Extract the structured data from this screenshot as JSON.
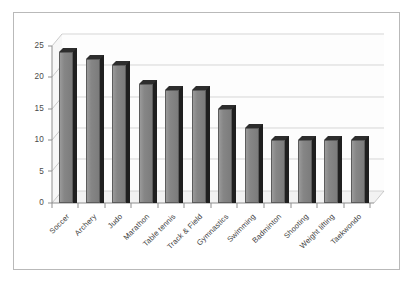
{
  "chart_data": {
    "type": "bar",
    "title": "",
    "subtitle": "",
    "xlabel": "",
    "ylabel": "",
    "categories": [
      "Soccer",
      "Archery",
      "Judo",
      "Marathon",
      "Table tennis",
      "Track & Field",
      "Gymnastics",
      "Swimming",
      "Badminton",
      "Shooting",
      "Weight lifting",
      "Taekwondo"
    ],
    "values": [
      24,
      23,
      22,
      19,
      18,
      18,
      15,
      12,
      10,
      10,
      10,
      10
    ],
    "ylim": [
      0,
      25
    ],
    "ytick_values": [
      0,
      5,
      10,
      15,
      20,
      25
    ],
    "ytick_labels": [
      "0",
      "5",
      "10",
      "15",
      "20",
      "25"
    ],
    "grid": true,
    "grid_axis": "y",
    "legend": false,
    "legend_position": "none",
    "style": "3d-column",
    "colors": {
      "bar_face": "#868686",
      "bar_side": "#1f1f1f",
      "bar_top": "#2d2d2d",
      "bar_outline": "#5c5c5c",
      "grid_line": "#bfbfbf",
      "axis_line": "#9a9a9a",
      "frame_border": "#b9b9b9",
      "background": "#ffffff",
      "wall_back": "#fdfdfd",
      "wall_floor": "#f2f2f2",
      "tick_text": "#4a4a4a",
      "category_text": "#3d3d3d"
    }
  }
}
